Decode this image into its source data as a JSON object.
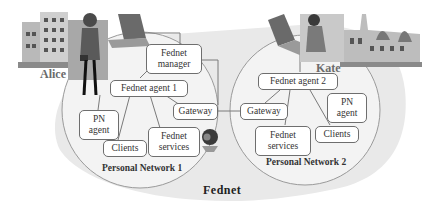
{
  "diagram": {
    "outer_network": {
      "label": "Fednet"
    },
    "networks": [
      {
        "label": "Personal Network  1",
        "owner": "Alice",
        "nodes": {
          "manager": "Fednet\nmanager",
          "agent": "Fednet agent 1",
          "gateway": "Gateway",
          "pn_agent": "PN\nagent",
          "clients": "Clients",
          "services": "Fednet\nservices"
        }
      },
      {
        "label": "Personal Network 2",
        "owner": "Kate",
        "nodes": {
          "agent": "Fednet agent 2",
          "gateway": "Gateway",
          "pn_agent": "PN\nagent",
          "clients": "Clients",
          "services": "Fednet\nservices"
        }
      }
    ],
    "icons": [
      "building-icon",
      "woman-icon",
      "laptop-icon",
      "webcam-icon",
      "castle-icon"
    ],
    "colors": {
      "outer_fill": "#e9e9e9",
      "circle_fill": "#f3f3f3",
      "circle_stroke": "#9a9a9a",
      "box_stroke": "#6e6e6e",
      "line": "#7a7a7a"
    }
  }
}
